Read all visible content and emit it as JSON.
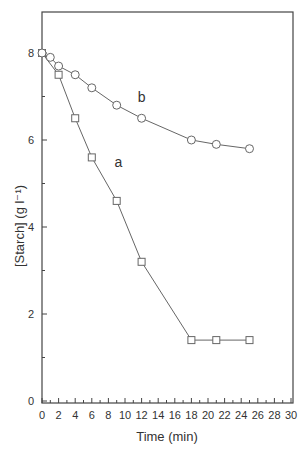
{
  "chart_data": {
    "type": "line",
    "title": "",
    "xlabel": "Time (min)",
    "ylabel": "[Starch] (g l⁻¹)",
    "xlim": [
      0,
      30
    ],
    "ylim": [
      0,
      9
    ],
    "x_ticks": [
      0,
      2,
      4,
      6,
      8,
      10,
      12,
      14,
      16,
      18,
      20,
      22,
      24,
      26,
      28,
      30
    ],
    "y_ticks": [
      0,
      2,
      4,
      6,
      8
    ],
    "grid": false,
    "legend": "none (inline labels)",
    "series": [
      {
        "name": "a",
        "marker": "square",
        "x": [
          0,
          2,
          4,
          6,
          9,
          12,
          18,
          21,
          25
        ],
        "values": [
          8.0,
          7.5,
          6.5,
          5.6,
          4.6,
          3.2,
          1.4,
          1.4,
          1.4
        ],
        "label_pos": [
          9.2,
          5.5
        ]
      },
      {
        "name": "b",
        "marker": "circle",
        "x": [
          0,
          1,
          2,
          4,
          6,
          9,
          12,
          18,
          21,
          25
        ],
        "values": [
          8.0,
          7.9,
          7.7,
          7.5,
          7.2,
          6.8,
          6.5,
          6.0,
          5.9,
          5.8
        ],
        "label_pos": [
          12.0,
          7.0
        ]
      }
    ]
  },
  "colors": {
    "line": "#666666",
    "frame": "#444444",
    "marker_fill": "#ffffff"
  }
}
